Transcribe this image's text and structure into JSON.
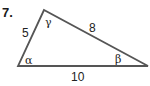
{
  "problem": {
    "number": "7."
  },
  "triangle": {
    "vertices": {
      "top": [
        44,
        10
      ],
      "bottom_left": [
        18,
        66
      ],
      "bottom_right": [
        148,
        66
      ]
    },
    "sides": {
      "left": "5",
      "right": "8",
      "bottom": "10"
    },
    "angles": {
      "top": "γ",
      "bottom_left": "α",
      "bottom_right": "β"
    },
    "stroke_color": "#555555"
  }
}
